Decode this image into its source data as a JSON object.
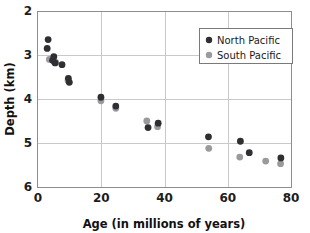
{
  "chart_data": {
    "type": "scatter",
    "title": "",
    "xlabel": "Age (in millions of years)",
    "ylabel": "Depth (km)",
    "xlim": [
      0,
      80
    ],
    "ylim": [
      2,
      6
    ],
    "y_inverted": true,
    "grid": true,
    "xticks": [
      0,
      20,
      40,
      60,
      80
    ],
    "xticklabels": [
      "0",
      "20",
      "40",
      "60",
      "80"
    ],
    "yticks": [
      2,
      3,
      4,
      5,
      6
    ],
    "yticklabels": [
      "2",
      "3",
      "4",
      "5",
      "6"
    ],
    "legend_position": "upper right",
    "series": [
      {
        "name": "North Pacific",
        "color": "#2f2f33",
        "marker": "circle",
        "points": [
          {
            "x": 3.2,
            "y": 2.65
          },
          {
            "x": 2.9,
            "y": 2.85
          },
          {
            "x": 5.0,
            "y": 3.04
          },
          {
            "x": 4.6,
            "y": 3.12
          },
          {
            "x": 5.4,
            "y": 3.18
          },
          {
            "x": 7.6,
            "y": 3.22
          },
          {
            "x": 9.6,
            "y": 3.53
          },
          {
            "x": 9.9,
            "y": 3.62
          },
          {
            "x": 19.9,
            "y": 3.96
          },
          {
            "x": 24.6,
            "y": 4.16
          },
          {
            "x": 34.8,
            "y": 4.65
          },
          {
            "x": 38.0,
            "y": 4.55
          },
          {
            "x": 53.9,
            "y": 4.86
          },
          {
            "x": 64.0,
            "y": 4.96
          },
          {
            "x": 66.8,
            "y": 5.22
          },
          {
            "x": 76.8,
            "y": 5.34
          }
        ]
      },
      {
        "name": "South Pacific",
        "color": "#9a9a9e",
        "marker": "circle",
        "points": [
          {
            "x": 3.6,
            "y": 3.1
          },
          {
            "x": 5.1,
            "y": 3.15
          },
          {
            "x": 5.6,
            "y": 3.17
          },
          {
            "x": 9.5,
            "y": 3.58
          },
          {
            "x": 19.9,
            "y": 4.04
          },
          {
            "x": 24.6,
            "y": 4.21
          },
          {
            "x": 34.4,
            "y": 4.5
          },
          {
            "x": 37.8,
            "y": 4.63
          },
          {
            "x": 54.0,
            "y": 5.12
          },
          {
            "x": 63.8,
            "y": 5.32
          },
          {
            "x": 72.0,
            "y": 5.41
          },
          {
            "x": 76.7,
            "y": 5.47
          }
        ]
      }
    ]
  },
  "legend": {
    "items": [
      {
        "label": "North Pacific",
        "color": "#2f2f33"
      },
      {
        "label": "South Pacific",
        "color": "#9a9a9e"
      }
    ]
  }
}
